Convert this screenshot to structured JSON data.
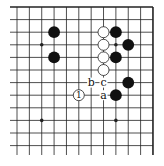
{
  "diagram": {
    "type": "go-board-fragment",
    "grid": {
      "cols": 12,
      "rows": 12,
      "x0": 17,
      "y0": 7,
      "dx": 12.36,
      "dy": 12.6,
      "left_open_extent": 10,
      "bottom_open_extent": 155,
      "border_top": true,
      "border_right": true,
      "line_color": "#222222"
    },
    "star_points": [
      [
        2,
        3
      ],
      [
        8,
        3
      ],
      [
        2,
        9
      ],
      [
        8,
        9
      ]
    ],
    "stones": [
      {
        "color": "black",
        "col": 3,
        "row": 2
      },
      {
        "color": "black",
        "col": 3,
        "row": 4
      },
      {
        "color": "black",
        "col": 8,
        "row": 2
      },
      {
        "color": "black",
        "col": 9,
        "row": 3
      },
      {
        "color": "black",
        "col": 8,
        "row": 4
      },
      {
        "color": "black",
        "col": 9,
        "row": 6
      },
      {
        "color": "black",
        "col": 8,
        "row": 7
      },
      {
        "color": "white",
        "col": 7,
        "row": 2
      },
      {
        "color": "white",
        "col": 7,
        "row": 3
      },
      {
        "color": "white",
        "col": 7,
        "row": 4
      },
      {
        "color": "white",
        "col": 7,
        "row": 5
      },
      {
        "color": "white",
        "col": 5,
        "row": 7,
        "label": "1"
      }
    ],
    "labels": [
      {
        "text": "b",
        "col": 6,
        "row": 6
      },
      {
        "text": "c",
        "col": 7,
        "row": 6
      },
      {
        "text": "a",
        "col": 7,
        "row": 7
      }
    ],
    "colors": {
      "black_stone": "#111111",
      "white_stone_fill": "#ffffff",
      "white_stone_stroke": "#222222",
      "background": "#ffffff"
    }
  }
}
